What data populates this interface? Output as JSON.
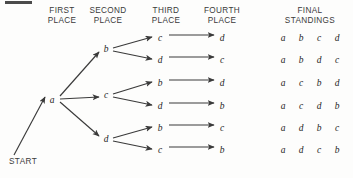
{
  "figure": {
    "type": "tree-diagram",
    "start_label": "START",
    "column_headers": [
      {
        "id": "first-place",
        "label": "FIRST\nPLACE",
        "x": 62,
        "y": 6
      },
      {
        "id": "second-place",
        "label": "SECOND\nPLACE",
        "x": 108,
        "y": 6
      },
      {
        "id": "third-place",
        "label": "THIRD\nPLACE",
        "x": 166,
        "y": 6
      },
      {
        "id": "fourth-place",
        "label": "FOURTH\nPLACE",
        "x": 222,
        "y": 6
      },
      {
        "id": "final-standings",
        "label": "FINAL\nSTANDINGS",
        "x": 310,
        "y": 6
      }
    ],
    "nodes": [
      {
        "id": "n-a",
        "label": "a",
        "level": 1,
        "x": 52,
        "y": 100
      },
      {
        "id": "n-b1",
        "label": "b",
        "level": 2,
        "x": 106,
        "y": 49
      },
      {
        "id": "n-c1",
        "label": "c",
        "level": 2,
        "x": 106,
        "y": 95
      },
      {
        "id": "n-d1",
        "label": "d",
        "level": 2,
        "x": 106,
        "y": 139
      },
      {
        "id": "n-3-r1",
        "label": "c",
        "level": 3,
        "x": 160,
        "y": 38
      },
      {
        "id": "n-3-r2",
        "label": "d",
        "level": 3,
        "x": 160,
        "y": 60
      },
      {
        "id": "n-3-r3",
        "label": "b",
        "level": 3,
        "x": 160,
        "y": 83
      },
      {
        "id": "n-3-r4",
        "label": "d",
        "level": 3,
        "x": 160,
        "y": 106
      },
      {
        "id": "n-3-r5",
        "label": "b",
        "level": 3,
        "x": 160,
        "y": 128
      },
      {
        "id": "n-3-r6",
        "label": "c",
        "level": 3,
        "x": 160,
        "y": 150
      },
      {
        "id": "n-4-r1",
        "label": "d",
        "level": 4,
        "x": 222,
        "y": 38
      },
      {
        "id": "n-4-r2",
        "label": "c",
        "level": 4,
        "x": 222,
        "y": 60
      },
      {
        "id": "n-4-r3",
        "label": "d",
        "level": 4,
        "x": 222,
        "y": 83
      },
      {
        "id": "n-4-r4",
        "label": "b",
        "level": 4,
        "x": 222,
        "y": 106
      },
      {
        "id": "n-4-r5",
        "label": "c",
        "level": 4,
        "x": 222,
        "y": 128
      },
      {
        "id": "n-4-r6",
        "label": "b",
        "level": 4,
        "x": 222,
        "y": 150
      }
    ],
    "edges": [
      {
        "from": "start",
        "to": "n-a",
        "x1": 14,
        "y1": 155,
        "x2": 45,
        "y2": 97
      },
      {
        "from": "n-a",
        "to": "n-b1",
        "x1": 60,
        "y1": 96,
        "x2": 99,
        "y2": 52
      },
      {
        "from": "n-a",
        "to": "n-c1",
        "x1": 60,
        "y1": 99,
        "x2": 99,
        "y2": 97
      },
      {
        "from": "n-a",
        "to": "n-d1",
        "x1": 60,
        "y1": 102,
        "x2": 99,
        "y2": 136
      },
      {
        "from": "n-b1",
        "to": "n-3-r1",
        "x1": 113,
        "y1": 48,
        "x2": 152,
        "y2": 37
      },
      {
        "from": "n-b1",
        "to": "n-3-r2",
        "x1": 113,
        "y1": 51,
        "x2": 152,
        "y2": 59
      },
      {
        "from": "n-c1",
        "to": "n-3-r3",
        "x1": 113,
        "y1": 94,
        "x2": 152,
        "y2": 82
      },
      {
        "from": "n-c1",
        "to": "n-3-r4",
        "x1": 113,
        "y1": 97,
        "x2": 152,
        "y2": 105
      },
      {
        "from": "n-d1",
        "to": "n-3-r5",
        "x1": 113,
        "y1": 138,
        "x2": 152,
        "y2": 127
      },
      {
        "from": "n-d1",
        "to": "n-3-r6",
        "x1": 113,
        "y1": 141,
        "x2": 152,
        "y2": 149
      },
      {
        "from": "n-3-r1",
        "to": "n-4-r1",
        "x1": 169,
        "y1": 35,
        "x2": 214,
        "y2": 35
      },
      {
        "from": "n-3-r2",
        "to": "n-4-r2",
        "x1": 169,
        "y1": 57,
        "x2": 214,
        "y2": 57
      },
      {
        "from": "n-3-r3",
        "to": "n-4-r3",
        "x1": 169,
        "y1": 80,
        "x2": 214,
        "y2": 80
      },
      {
        "from": "n-3-r4",
        "to": "n-4-r4",
        "x1": 169,
        "y1": 103,
        "x2": 214,
        "y2": 103
      },
      {
        "from": "n-3-r5",
        "to": "n-4-r5",
        "x1": 169,
        "y1": 125,
        "x2": 214,
        "y2": 125
      },
      {
        "from": "n-3-r6",
        "to": "n-4-r6",
        "x1": 169,
        "y1": 147,
        "x2": 214,
        "y2": 147
      }
    ],
    "standings_columns_x": [
      283,
      301,
      319,
      337
    ],
    "standings": [
      {
        "row": 1,
        "y": 38,
        "order": [
          "a",
          "b",
          "c",
          "d"
        ]
      },
      {
        "row": 2,
        "y": 60,
        "order": [
          "a",
          "b",
          "d",
          "c"
        ]
      },
      {
        "row": 3,
        "y": 83,
        "order": [
          "a",
          "c",
          "b",
          "d"
        ]
      },
      {
        "row": 4,
        "y": 106,
        "order": [
          "a",
          "c",
          "d",
          "b"
        ]
      },
      {
        "row": 5,
        "y": 128,
        "order": [
          "a",
          "d",
          "b",
          "c"
        ]
      },
      {
        "row": 6,
        "y": 150,
        "order": [
          "a",
          "d",
          "c",
          "b"
        ]
      }
    ],
    "colors": {
      "background": "#fdfdfc",
      "line": "#3a3a3a",
      "text": "#2b2b2b",
      "corner_bar": "#4b4b4b"
    },
    "corner_bar": {
      "x": 5,
      "y": 1,
      "width": 27,
      "height": 2.5
    }
  }
}
